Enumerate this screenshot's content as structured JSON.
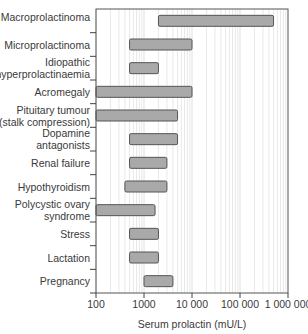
{
  "chart_data": {
    "type": "bar",
    "orientation": "horizontal-range",
    "title": "",
    "xlabel": "Serum prolactin (mU/L)",
    "ylabel": "",
    "xscale": "log",
    "xlim": [
      100,
      1000000
    ],
    "xticks": [
      100,
      1000,
      10000,
      100000,
      1000000
    ],
    "xtick_labels": [
      "100",
      "1000",
      "10 000",
      "100 000",
      "1 000 000"
    ],
    "grid": "vertical minor log gridlines",
    "legend": null,
    "categories": [
      "Macroprolactinoma",
      "Microprolactinoma",
      "Idiopathic hyperprolactinaemia",
      "Acromegaly",
      "Pituitary tumour (stalk compression)",
      "Dopamine antagonists",
      "Renal failure",
      "Hypothyroidism",
      "Polycystic ovary syndrome",
      "Stress",
      "Lactation",
      "Pregnancy"
    ],
    "ranges": [
      {
        "min": 2000,
        "max": 500000
      },
      {
        "min": 500,
        "max": 10000
      },
      {
        "min": 500,
        "max": 2000
      },
      {
        "min": 100,
        "max": 10000
      },
      {
        "min": 100,
        "max": 5000
      },
      {
        "min": 500,
        "max": 5000
      },
      {
        "min": 500,
        "max": 3000
      },
      {
        "min": 400,
        "max": 3000
      },
      {
        "min": 100,
        "max": 1700
      },
      {
        "min": 500,
        "max": 2000
      },
      {
        "min": 500,
        "max": 2000
      },
      {
        "min": 1000,
        "max": 4000
      }
    ]
  },
  "labels": {
    "rows": [
      [
        "Macroprolactinoma"
      ],
      [
        "Microprolactinoma"
      ],
      [
        "Idiopathic",
        "hyperprolactinaemia"
      ],
      [
        "Acromegaly"
      ],
      [
        "Pituitary tumour",
        "(stalk compression)"
      ],
      [
        "Dopamine",
        "antagonists"
      ],
      [
        "Renal failure"
      ],
      [
        "Hypothyroidism"
      ],
      [
        "Polycystic ovary",
        "syndrome"
      ],
      [
        "Stress"
      ],
      [
        "Lactation"
      ],
      [
        "Pregnancy"
      ]
    ],
    "xticks": [
      "100",
      "1000",
      "10 000",
      "100 000",
      "1 000 000"
    ],
    "xlabel": "Serum prolactin (mU/L)"
  },
  "colors": {
    "bar_fill": "#a9a9a9",
    "bar_stroke": "#555555",
    "grid": "#d8d8d8",
    "axis": "#444444"
  }
}
